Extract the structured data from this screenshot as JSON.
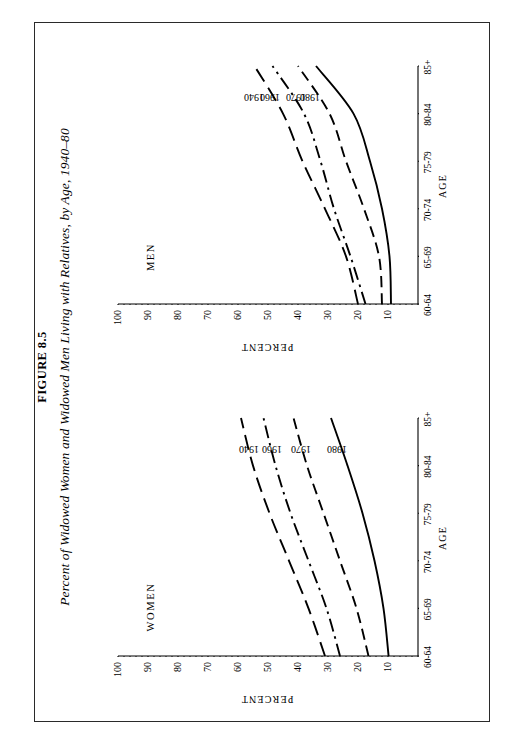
{
  "figure": {
    "number": "FIGURE 8.5",
    "title": "Percent of Widowed Women and Widowed Men Living with Relatives, by Age, 1940–80"
  },
  "panels": {
    "women_title": "WOMEN",
    "men_title": "MEN"
  },
  "axis": {
    "y_name": "PERCENT",
    "x_name": "AGE"
  },
  "colors": {
    "ink": "#000000",
    "frame": "#2a2a2a",
    "paper": "#ffffff"
  },
  "chart_data": [
    {
      "type": "line",
      "title": "WOMEN",
      "xlabel": "AGE",
      "ylabel": "PERCENT",
      "categories": [
        "60-64",
        "65-69",
        "70-74",
        "75-79",
        "80-84",
        "85+"
      ],
      "ylim": [
        0,
        100
      ],
      "yticks": [
        0,
        10,
        20,
        30,
        40,
        50,
        60,
        70,
        80,
        90,
        100
      ],
      "ytick_labels": [
        "",
        "10",
        "20",
        "30",
        "40",
        "50",
        "60",
        "70",
        "80",
        "90",
        "100"
      ],
      "minor_tick_step": 2,
      "grid": false,
      "legend": "inline-series-labels",
      "series": [
        {
          "name": "1940",
          "style": "long-dash",
          "values": [
            31.0,
            36.5,
            43.0,
            49.5,
            55.0,
            59.0
          ]
        },
        {
          "name": "1960",
          "style": "dash-dot",
          "values": [
            26.0,
            30.5,
            36.5,
            42.5,
            47.5,
            51.5
          ]
        },
        {
          "name": "1970",
          "style": "dash",
          "values": [
            16.5,
            20.5,
            26.0,
            31.5,
            37.0,
            41.5
          ]
        },
        {
          "name": "1980",
          "style": "solid",
          "values": [
            9.8,
            11.5,
            14.5,
            18.5,
            23.5,
            29.0
          ]
        }
      ]
    },
    {
      "type": "line",
      "title": "MEN",
      "xlabel": "AGE",
      "ylabel": "PERCENT",
      "categories": [
        "60-64",
        "65-69",
        "70-74",
        "75-79",
        "80-84",
        "85+"
      ],
      "ylim": [
        0,
        100
      ],
      "yticks": [
        0,
        10,
        20,
        30,
        40,
        50,
        60,
        70,
        80,
        90,
        100
      ],
      "ytick_labels": [
        "",
        "10",
        "20",
        "30",
        "40",
        "50",
        "60",
        "70",
        "80",
        "90",
        "100"
      ],
      "minor_tick_step": 2,
      "grid": false,
      "legend": "inline-series-labels",
      "series": [
        {
          "name": "1940",
          "style": "long-dash",
          "values": [
            20.0,
            24.0,
            31.0,
            38.5,
            45.0,
            54.5
          ]
        },
        {
          "name": "1960",
          "style": "dash-dot",
          "values": [
            17.5,
            22.5,
            28.0,
            32.5,
            38.0,
            48.5
          ]
        },
        {
          "name": "1970",
          "style": "dash",
          "values": [
            12.0,
            13.0,
            18.0,
            24.0,
            29.5,
            40.0
          ]
        },
        {
          "name": "1980",
          "style": "solid",
          "values": [
            9.0,
            9.5,
            12.0,
            16.0,
            21.5,
            34.0
          ]
        }
      ]
    }
  ]
}
